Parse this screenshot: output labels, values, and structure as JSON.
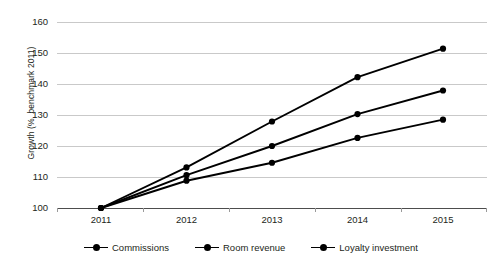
{
  "chart_data": {
    "type": "line",
    "title": "",
    "xlabel": "",
    "ylabel": "Growth (%, benchmark 2011)",
    "categories": [
      "2011",
      "2012",
      "2013",
      "2014",
      "2015"
    ],
    "x": [
      2011,
      2012,
      2013,
      2014,
      2015
    ],
    "ylim": [
      100,
      160
    ],
    "yticks": [
      100,
      110,
      120,
      130,
      140,
      150,
      160
    ],
    "ytick_labels": [
      "100",
      "110",
      "120",
      "130",
      "140",
      "150",
      "160"
    ],
    "grid": "horizontal",
    "legend_position": "bottom-center",
    "series": [
      {
        "name": "Commissions",
        "values": [
          100,
          113.1,
          127.9,
          142.2,
          151.4
        ],
        "color": "#000000"
      },
      {
        "name": "Room revenue",
        "values": [
          100,
          110.6,
          120.0,
          130.3,
          137.9
        ],
        "color": "#000000"
      },
      {
        "name": "Loyalty investment",
        "values": [
          100,
          108.8,
          114.6,
          122.6,
          128.5
        ],
        "color": "#000000"
      }
    ]
  },
  "legend": {
    "items": [
      {
        "label": "Commissions"
      },
      {
        "label": "Room revenue"
      },
      {
        "label": "Loyalty investment"
      }
    ]
  },
  "colors": {
    "series": "#000000",
    "gridline": "#c9c9c9",
    "axis": "#4d4d4d",
    "text": "#231f20",
    "background": "#ffffff"
  }
}
